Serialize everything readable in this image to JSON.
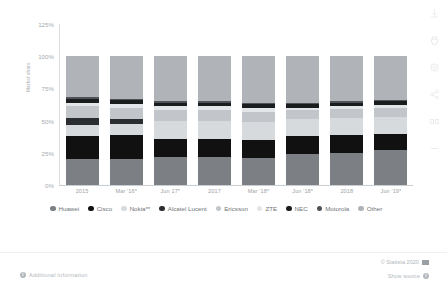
{
  "axis": {
    "y_title": "Market share",
    "y_ticks": [
      "125%",
      "100%",
      "75%",
      "50%",
      "25%",
      "0%"
    ]
  },
  "footer": {
    "additional_information": "Additional Information",
    "copyright": "© Statista 2020",
    "show_source": "Show source",
    "info_glyph": "i"
  },
  "rail": {
    "items": [
      {
        "name": "download-icon"
      },
      {
        "name": "print-icon"
      },
      {
        "name": "settings-icon"
      },
      {
        "name": "share-icon"
      },
      {
        "name": "compare-icon"
      },
      {
        "name": "more-icon"
      }
    ]
  },
  "chart_data": {
    "type": "bar",
    "title": "",
    "xlabel": "",
    "ylabel": "Market share",
    "ylim": [
      0,
      125
    ],
    "grid": false,
    "legend_position": "bottom",
    "stacked": true,
    "categories": [
      "2015",
      "Mar '16*",
      "Jun 17*",
      "2017",
      "Mar '18*",
      "Jun '18*",
      "2018",
      "Jun '19*"
    ],
    "series": [
      {
        "name": "Huawei",
        "color": "#7c7f83",
        "values": [
          20,
          20,
          22,
          22,
          21,
          24,
          25,
          27
        ]
      },
      {
        "name": "Cisco",
        "color": "#111111",
        "values": [
          18,
          19,
          14,
          14,
          14,
          14,
          14,
          13
        ]
      },
      {
        "name": "Nokia**",
        "color": "#d7dadd",
        "values": [
          9,
          8,
          14,
          14,
          14,
          13,
          13,
          13
        ]
      },
      {
        "name": "Alcatel Lucent",
        "color": "#2b2d30",
        "values": [
          5,
          4,
          0,
          0,
          0,
          0,
          0,
          0
        ]
      },
      {
        "name": "Ericsson",
        "color": "#c2c6ca",
        "values": [
          9,
          9,
          8,
          8,
          8,
          7,
          7,
          7
        ]
      },
      {
        "name": "ZTE",
        "color": "#e3e6e8",
        "values": [
          3,
          3,
          3,
          3,
          3,
          2,
          2,
          2
        ]
      },
      {
        "name": "NEC",
        "color": "#1a1c1e",
        "values": [
          3,
          3,
          3,
          3,
          3,
          3,
          3,
          3
        ]
      },
      {
        "name": "Motorola",
        "color": "#4f5256",
        "values": [
          1,
          1,
          1,
          1,
          1,
          1,
          1,
          1
        ]
      },
      {
        "name": "Other",
        "color": "#b0b4b8",
        "values": [
          32,
          33,
          35,
          35,
          36,
          36,
          35,
          34
        ]
      }
    ]
  }
}
